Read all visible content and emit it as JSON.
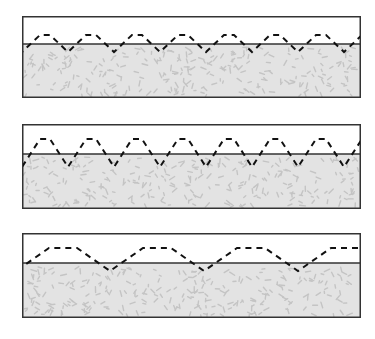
{
  "figure": {
    "colors": {
      "frame": "#333333",
      "interface_line": "#333333",
      "wave": "#111111",
      "medium_fill": "#e3e3e3",
      "medium_speckle": "#c4c4c4",
      "background": "#ffffff"
    },
    "panels": [
      {
        "name": "panel-top",
        "top": 16,
        "height": 82,
        "interface_y": 28,
        "wave": {
          "period": 46,
          "crest_y": 19,
          "trough_y": 36,
          "flat_len": 10,
          "phase": 0
        }
      },
      {
        "name": "panel-middle",
        "top": 124,
        "height": 85,
        "interface_y": 30,
        "wave": {
          "period": 46,
          "crest_y": 15,
          "trough_y": 43,
          "flat_len": 10,
          "phase": 0
        }
      },
      {
        "name": "panel-bottom",
        "top": 233,
        "height": 85,
        "interface_y": 30,
        "wave": {
          "period": 94,
          "crest_y": 15,
          "trough_y": 38,
          "flat_len": 28,
          "phase": -6
        }
      }
    ]
  }
}
